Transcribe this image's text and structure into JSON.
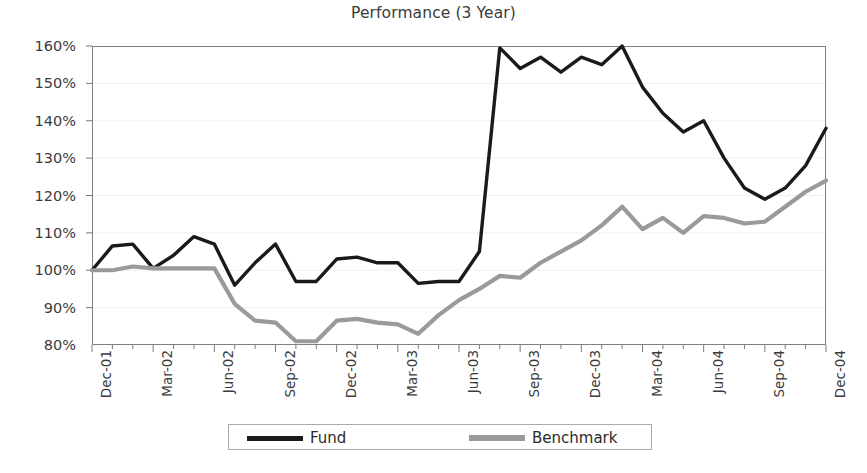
{
  "chart_data": {
    "type": "line",
    "title": "Performance (3 Year)",
    "xlabel": "",
    "ylabel": "",
    "ylim": [
      80,
      160
    ],
    "ytick_labels": [
      "80%",
      "90%",
      "100%",
      "110%",
      "120%",
      "130%",
      "140%",
      "150%",
      "160%"
    ],
    "yticks": [
      80,
      90,
      100,
      110,
      120,
      130,
      140,
      150,
      160
    ],
    "grid": true,
    "legend_position": "bottom",
    "x": [
      "Dec-01",
      "Jan-02",
      "Feb-02",
      "Mar-02",
      "Apr-02",
      "May-02",
      "Jun-02",
      "Jul-02",
      "Aug-02",
      "Sep-02",
      "Oct-02",
      "Nov-02",
      "Dec-02",
      "Jan-03",
      "Feb-03",
      "Mar-03",
      "Apr-03",
      "May-03",
      "Jun-03",
      "Jul-03",
      "Aug-03",
      "Sep-03",
      "Oct-03",
      "Nov-03",
      "Dec-03",
      "Jan-04",
      "Feb-04",
      "Mar-04",
      "Apr-04",
      "May-04",
      "Jun-04",
      "Jul-04",
      "Aug-04",
      "Sep-04",
      "Oct-04",
      "Nov-04",
      "Dec-04"
    ],
    "tick_labels": [
      "Dec-01",
      "Mar-02",
      "Jun-02",
      "Sep-02",
      "Dec-02",
      "Mar-03",
      "Jun-03",
      "Sep-03",
      "Dec-03",
      "Mar-04",
      "Jun-04",
      "Sep-04",
      "Dec-04"
    ],
    "series": [
      {
        "name": "Fund",
        "color": "#1a1a1a",
        "values": [
          100,
          106.5,
          107,
          100.5,
          104,
          109,
          107,
          96,
          102,
          107,
          97,
          97,
          103,
          103.5,
          102,
          102,
          96.5,
          97,
          97,
          105,
          159.5,
          154,
          157,
          153,
          157,
          155,
          160,
          149,
          142,
          137,
          140,
          130,
          122,
          119,
          122,
          128,
          138
        ]
      },
      {
        "name": "Benchmark",
        "color": "#9a9a9a",
        "values": [
          100,
          100,
          101,
          100.5,
          100.5,
          100.5,
          100.5,
          91,
          86.5,
          86,
          81,
          81,
          86.5,
          87,
          86,
          85.5,
          83,
          88,
          92,
          95,
          98.5,
          98,
          102,
          105,
          108,
          112,
          117,
          111,
          114,
          110,
          114.5,
          114,
          112.5,
          113,
          117,
          121,
          124
        ]
      }
    ]
  },
  "legend": {
    "items": [
      {
        "label": "Fund",
        "color": "#1a1a1a"
      },
      {
        "label": "Benchmark",
        "color": "#9a9a9a"
      }
    ]
  }
}
